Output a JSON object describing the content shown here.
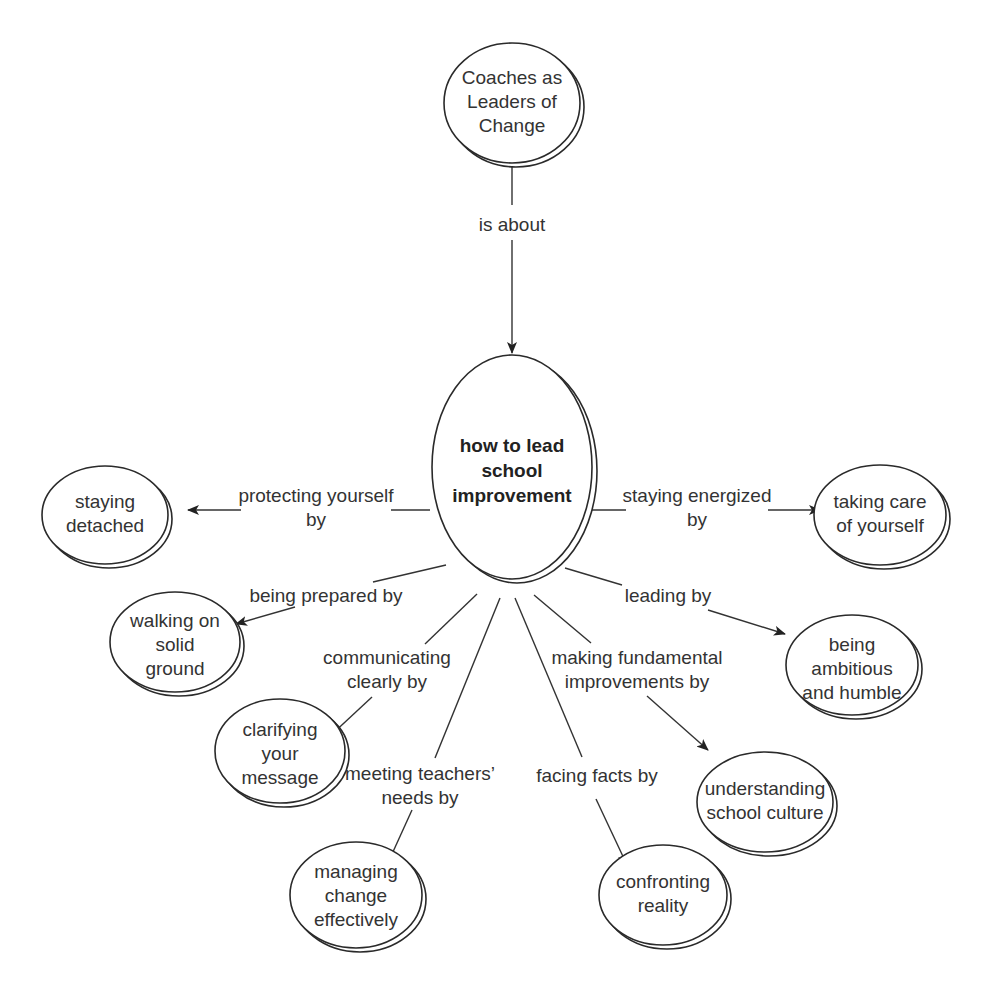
{
  "diagram": {
    "type": "concept-map",
    "nodes": {
      "root": {
        "lines": [
          "Coaches as",
          "Leaders of",
          "Change"
        ]
      },
      "center": {
        "lines": [
          "how to lead",
          "school",
          "improvement"
        ]
      },
      "staying_detached": {
        "lines": [
          "staying",
          "detached"
        ]
      },
      "taking_care": {
        "lines": [
          "taking care",
          "of yourself"
        ]
      },
      "walking_solid": {
        "lines": [
          "walking on",
          "solid",
          "ground"
        ]
      },
      "ambitious_humble": {
        "lines": [
          "being",
          "ambitious",
          "and humble"
        ]
      },
      "clarifying": {
        "lines": [
          "clarifying",
          "your",
          "message"
        ]
      },
      "school_culture": {
        "lines": [
          "understanding",
          "school culture"
        ]
      },
      "managing_change": {
        "lines": [
          "managing",
          "change",
          "effectively"
        ]
      },
      "confronting": {
        "lines": [
          "confronting",
          "reality"
        ]
      }
    },
    "edges": {
      "is_about": {
        "lines": [
          "is about"
        ]
      },
      "protecting": {
        "lines": [
          "protecting yourself",
          "by"
        ]
      },
      "energized": {
        "lines": [
          "staying energized",
          "by"
        ]
      },
      "prepared": {
        "lines": [
          "being prepared by"
        ]
      },
      "leading": {
        "lines": [
          "leading by"
        ]
      },
      "communicating": {
        "lines": [
          "communicating",
          "clearly by"
        ]
      },
      "fundamental": {
        "lines": [
          "making fundamental",
          "improvements by"
        ]
      },
      "teachers": {
        "lines": [
          "meeting teachers’",
          "needs by"
        ]
      },
      "facts": {
        "lines": [
          "facing facts by"
        ]
      }
    },
    "colors": {
      "stroke": "#2a2a2a",
      "text": "#333333",
      "shadow": "#cfcfcf",
      "background": "#ffffff"
    }
  }
}
